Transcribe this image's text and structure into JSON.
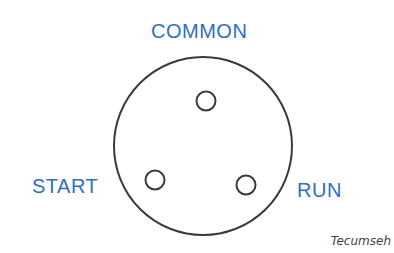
{
  "diagram": {
    "labels": {
      "common": "COMMON",
      "start": "START",
      "run": "RUN"
    },
    "brand": "Tecumseh",
    "outer_circle": {
      "cx": 203,
      "cy": 146,
      "r": 89
    },
    "pins": [
      {
        "name": "common",
        "cx": 206,
        "cy": 101,
        "r": 10
      },
      {
        "name": "start",
        "cx": 155,
        "cy": 180,
        "r": 10
      },
      {
        "name": "run",
        "cx": 246,
        "cy": 185,
        "r": 10
      }
    ],
    "colors": {
      "label": "#2f6fc0",
      "stroke": "#3a3a3a",
      "brand": "#444444",
      "background": "#ffffff"
    }
  }
}
